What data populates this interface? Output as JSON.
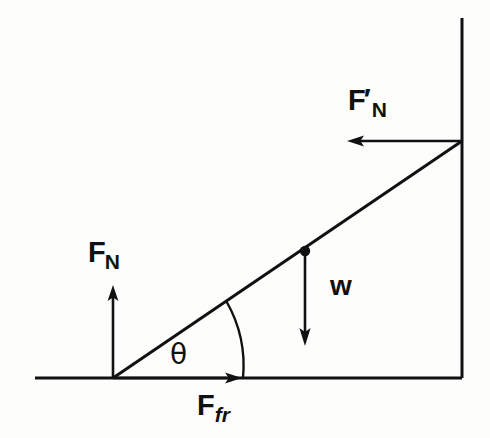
{
  "figure": {
    "type": "free-body-diagram",
    "background_color": "#fdfdfc",
    "stroke_color": "#111111"
  },
  "labels": {
    "normal_ground": {
      "base": "F",
      "subscript": "N",
      "prime": ""
    },
    "normal_wall": {
      "base": "F",
      "subscript": "N",
      "prime": "′"
    },
    "weight": {
      "text": "w"
    },
    "friction": {
      "base": "F",
      "subscript": "fr",
      "prime": ""
    },
    "angle": {
      "text": "θ"
    }
  },
  "geometry": {
    "ground_line": {
      "x1": 35,
      "y1": 378,
      "x2": 462,
      "y2": 378
    },
    "wall_line": {
      "x1": 462,
      "y1": 18,
      "x2": 462,
      "y2": 378
    },
    "ladder_line": {
      "x1": 113,
      "y1": 378,
      "x2": 462,
      "y2": 141
    },
    "center_of_mass_dot": {
      "cx": 305,
      "cy": 251,
      "r": 5
    },
    "angle_arc": {
      "start_x": 243,
      "start_y": 378,
      "end_x": 226,
      "end_y": 301,
      "radius": 78
    }
  },
  "vectors": [
    {
      "name": "F_N",
      "description": "normal force from ground on ladder base",
      "direction": "up",
      "x1": 113,
      "y1": 378,
      "x2": 113,
      "y2": 286
    },
    {
      "name": "F_N_prime",
      "description": "normal force from wall on ladder top",
      "direction": "left",
      "x1": 462,
      "y1": 141,
      "x2": 348,
      "y2": 141
    },
    {
      "name": "w",
      "description": "weight of ladder acting at center of mass",
      "direction": "down",
      "x1": 305,
      "y1": 251,
      "x2": 305,
      "y2": 345
    },
    {
      "name": "F_fr",
      "description": "friction force at ladder base along ground",
      "direction": "right",
      "x1": 113,
      "y1": 378,
      "x2": 241,
      "y2": 378
    }
  ]
}
